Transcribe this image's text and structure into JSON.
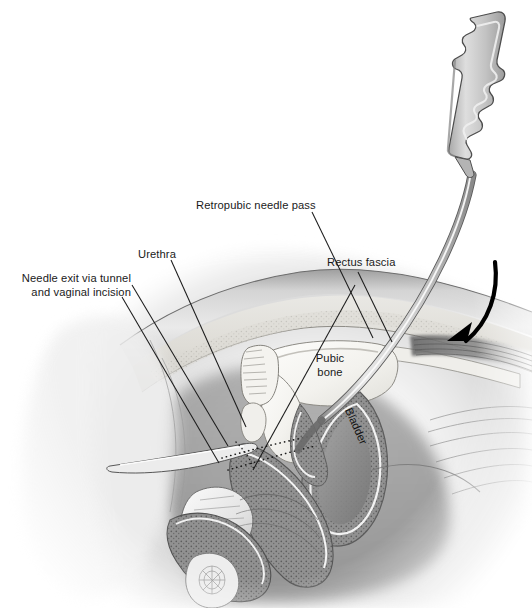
{
  "figure": {
    "style": "grayscale medical line-and-wash illustration",
    "background_color": "#ffffff",
    "width": 532,
    "height": 608
  },
  "labels": {
    "retropubic_needle_pass": "Retropubic needle pass",
    "urethra": "Urethra",
    "needle_exit_line1": "Needle exit via tunnel",
    "needle_exit_line2": "and vaginal incision",
    "rectus_fascia": "Rectus fascia",
    "pubic_bone_line1": "Pubic",
    "pubic_bone_line2": "bone",
    "bladder": "Bladder"
  },
  "colors": {
    "label_text": "#1a1a1a",
    "leader_line": "#1c1c1c",
    "arrow": "#000000",
    "instrument_fill": "#c9c9c9",
    "instrument_outline": "#4a4a4a",
    "bone_fill": "#f2f1ee",
    "tissue_mid": "#b9b9b9",
    "tissue_dark": "#6e6e6e",
    "bladder_wall": "#8f8f8f"
  },
  "annotations": {
    "arrow_description": "curved black arrow indicating needle insertion direction, pointing down-left toward retropubic space",
    "dotted_path": "dotted line marking the tunnel / vaginal incision trajectory",
    "leader_count": 6
  }
}
